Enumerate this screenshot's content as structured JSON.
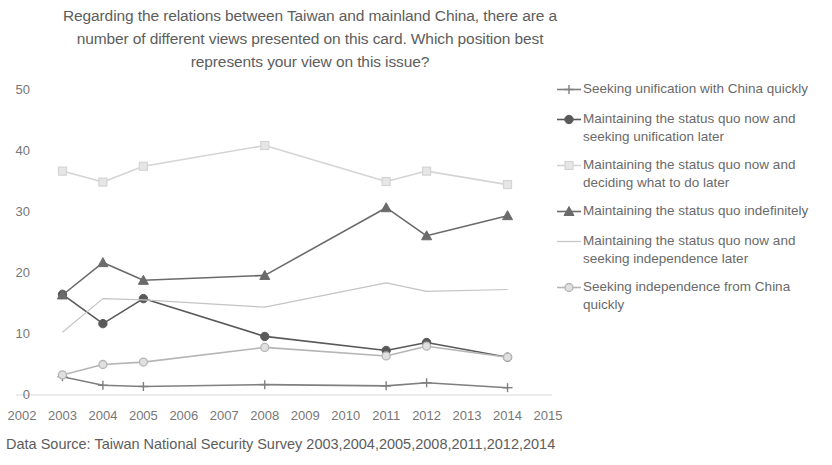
{
  "title": {
    "lines": [
      "Regarding the relations between Taiwan and mainland China, there are a",
      "number of different views presented on this card. Which position best",
      "represents your view on this issue?"
    ]
  },
  "footnote": "Data Source: Taiwan National Security Survey  2003,2004,2005,2008,2011,2012,2014",
  "legend": {
    "items": [
      {
        "label": "Seeking unification with China quickly",
        "marker": "plus-marker",
        "color": "#7f7f7f"
      },
      {
        "label": "Maintaining the status quo now and seeking unification later",
        "marker": "circle-filled-marker",
        "color": "#595959"
      },
      {
        "label": "Maintaining the status quo now and deciding what to do later",
        "marker": "square-marker",
        "color": "#d4d4d4"
      },
      {
        "label": "Maintaining the status quo indefinitely",
        "marker": "triangle-marker",
        "color": "#6b6b6b"
      },
      {
        "label": "Maintaining the status quo now and seeking independence later",
        "marker": "line-marker",
        "color": "#c4c4c4"
      },
      {
        "label": "Seeking independence from China quickly",
        "marker": "circle-light-marker",
        "color": "#b5b5b5"
      }
    ]
  },
  "axes": {
    "yticks": [
      "0",
      "10",
      "20",
      "30",
      "40",
      "50"
    ],
    "xticks": [
      "2002",
      "2003",
      "2004",
      "2005",
      "2006",
      "2007",
      "2008",
      "2009",
      "2010",
      "2011",
      "2012",
      "2013",
      "2014",
      "2015"
    ]
  },
  "chart_data": {
    "type": "line",
    "title": "Regarding the relations between Taiwan and mainland China, there are a number of different views presented on this card. Which position best represents your view on this issue?",
    "xlabel": "",
    "ylabel": "",
    "x": [
      2003,
      2004,
      2005,
      2008,
      2011,
      2012,
      2014
    ],
    "xlim": [
      2002,
      2015
    ],
    "ylim": [
      0,
      50
    ],
    "grid": false,
    "legend_position": "right",
    "series": [
      {
        "name": "Seeking unification with China quickly",
        "marker": "plus",
        "color": "#7f7f7f",
        "values": [
          3.0,
          1.6,
          1.4,
          1.7,
          1.5,
          2.0,
          1.2
        ]
      },
      {
        "name": "Maintaining the status quo now and seeking unification later",
        "marker": "circle-filled",
        "color": "#595959",
        "values": [
          16.5,
          11.7,
          15.8,
          9.6,
          7.3,
          8.6,
          6.2
        ]
      },
      {
        "name": "Maintaining the status quo now and deciding what to do later",
        "marker": "square",
        "color": "#d4d4d4",
        "values": [
          36.7,
          34.9,
          37.5,
          40.9,
          35.0,
          36.7,
          34.5
        ]
      },
      {
        "name": "Maintaining the status quo indefinitely",
        "marker": "triangle",
        "color": "#6b6b6b",
        "values": [
          16.4,
          21.7,
          18.8,
          19.6,
          30.7,
          26.1,
          29.4
        ]
      },
      {
        "name": "Maintaining the status quo now and seeking independence later",
        "marker": "none",
        "color": "#c4c4c4",
        "values": [
          10.3,
          15.8,
          15.6,
          14.4,
          18.4,
          17.0,
          17.3
        ]
      },
      {
        "name": "Seeking independence from China quickly",
        "marker": "circle-light",
        "color": "#b5b5b5",
        "values": [
          3.3,
          5.0,
          5.4,
          7.8,
          6.4,
          8.0,
          6.2
        ]
      }
    ]
  }
}
